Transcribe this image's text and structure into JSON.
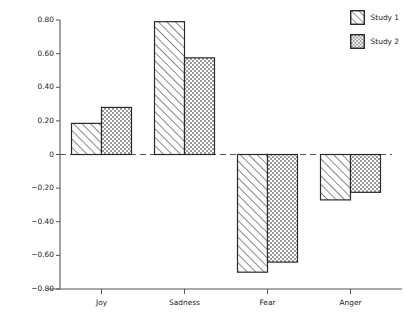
{
  "chart_data": {
    "type": "bar",
    "title": "",
    "subtitle": "",
    "xlabel": "",
    "ylabel": "Deviation from the mean",
    "categories": [
      "Joy",
      "Sadness",
      "Fear",
      "Anger"
    ],
    "series": [
      {
        "name": "Study 1",
        "values": [
          0.185,
          0.79,
          -0.7,
          -0.27
        ],
        "pattern": "diagonal-hatch"
      },
      {
        "name": "Study 2",
        "values": [
          0.28,
          0.575,
          -0.64,
          -0.225
        ],
        "pattern": "checker-crosshatch"
      }
    ],
    "ylim": [
      -0.8,
      0.8
    ],
    "yticks": [
      0.8,
      0.6,
      0.4,
      0.2,
      0,
      -0.2,
      -0.4,
      -0.6,
      -0.8
    ],
    "ytick_labels": [
      "0.80",
      "0.60",
      "0.40",
      "0.20",
      "0",
      "−0.20",
      "−0.40",
      "−0.60",
      "−0.80"
    ],
    "grid": false,
    "zero_line": {
      "value": 0,
      "style": "dashed"
    },
    "legend": {
      "position": "top-right",
      "entries": [
        "Study 1",
        "Study 2"
      ]
    },
    "colors": {
      "bar_edge": "#2a2a2a",
      "bar_fill": "#ffffff",
      "hatch": "#555555",
      "axis": "#555555",
      "text": "#222222",
      "background": "#ffffff"
    }
  }
}
